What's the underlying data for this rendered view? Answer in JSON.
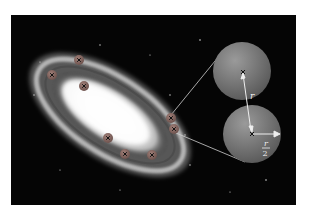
{
  "figure": {
    "labels": {
      "separation": "r",
      "radius_num": "r",
      "radius_den": "2"
    },
    "markers": [
      {
        "x": 79,
        "y": 60
      },
      {
        "x": 52,
        "y": 75
      },
      {
        "x": 84,
        "y": 86
      },
      {
        "x": 171,
        "y": 118
      },
      {
        "x": 174,
        "y": 129
      },
      {
        "x": 108,
        "y": 138
      },
      {
        "x": 125,
        "y": 154
      },
      {
        "x": 152,
        "y": 155
      }
    ],
    "colors": {
      "background": "#050505",
      "sphere": "#7a7a7a",
      "marker": "#8a6a64",
      "arrow": "#e8e8e8"
    }
  }
}
